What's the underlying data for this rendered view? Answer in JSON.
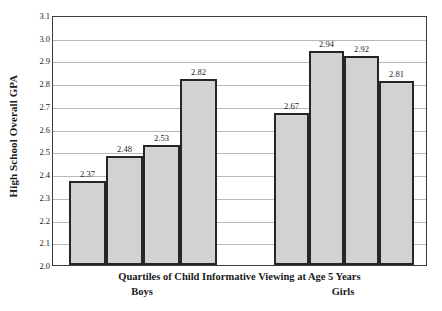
{
  "chart_data": {
    "type": "bar",
    "title": "",
    "xlabel": "Quartiles of Child Informative Viewing at Age 5 Years",
    "ylabel": "High School Overall GPA",
    "ylim": [
      2.0,
      3.1
    ],
    "ytick_labels": [
      "3.1",
      "3.0",
      "2.9",
      "2.8",
      "2.7",
      "2.6",
      "2.5",
      "2.4",
      "2.3",
      "2.2",
      "2.1",
      "2.0"
    ],
    "ytick_values": [
      3.1,
      3.0,
      2.9,
      2.8,
      2.7,
      2.6,
      2.5,
      2.4,
      2.3,
      2.2,
      2.1,
      2.0
    ],
    "grid": true,
    "legend": false,
    "groups": [
      {
        "name": "Boys",
        "categories": [
          "Quartile 1",
          "Quartile 2",
          "Quartile 3",
          "Quartile 4"
        ],
        "values": [
          2.37,
          2.48,
          2.53,
          2.82
        ],
        "value_labels": [
          "2.37",
          "2.48",
          "2.53",
          "2.82"
        ]
      },
      {
        "name": "Girls",
        "categories": [
          "Quartile 1",
          "Quartile 2",
          "Quartile 3",
          "Quartile 4"
        ],
        "values": [
          2.67,
          2.94,
          2.92,
          2.81
        ],
        "value_labels": [
          "2.67",
          "2.94",
          "2.92",
          "2.81"
        ]
      }
    ],
    "colors": {
      "bar_fill": "#d2d2d2",
      "bar_border": "#262626",
      "gridline": "#b8b8b8",
      "frame": "#3c3c3c",
      "text": "#1a1a1a",
      "background": "#ffffff"
    }
  },
  "axis": {
    "y_title": "High School Overall GPA",
    "x_title": "Quartiles of Child Informative Viewing at Age 5 Years"
  },
  "group_labels": {
    "boys": "Boys",
    "girls": "Girls"
  }
}
